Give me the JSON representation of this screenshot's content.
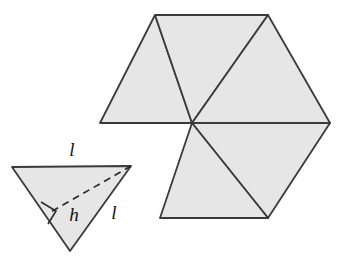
{
  "figure": {
    "title": "Equilateral triangle with altitude and hexagon net of six triangles",
    "background_color": "#ffffff",
    "fill_color": "#e6e6e6",
    "stroke_color": "#3a3a3a",
    "label_color": "#111111",
    "stroke_width": 1.8
  },
  "triangle": {
    "name": "labelled-equilateral-triangle",
    "vertices": {
      "top_left": [
        12,
        167
      ],
      "top_right": [
        131,
        166
      ],
      "bottom_apex": [
        70,
        251
      ]
    },
    "altitude": {
      "from": [
        131,
        166
      ],
      "to": [
        49,
        213
      ],
      "style": "dashed",
      "label": "h",
      "label_position": [
        74,
        216
      ]
    },
    "right_angle_marker": {
      "present": true,
      "position": [
        49,
        213
      ],
      "size": 16
    },
    "labels": [
      {
        "text": "l",
        "position": [
          72,
          152
        ],
        "side": "top-edge"
      },
      {
        "text": "h",
        "position": [
          74,
          216
        ],
        "side": "altitude"
      },
      {
        "text": "l",
        "position": [
          114,
          214
        ],
        "side": "right-edge"
      }
    ]
  },
  "hexagon_net": {
    "name": "hexagon-net-five-triangles",
    "center": [
      192,
      123
    ],
    "outer_vertices": {
      "left": [
        100,
        123
      ],
      "top_left": [
        155,
        15
      ],
      "top_right": [
        268,
        15
      ],
      "right": [
        330,
        123
      ],
      "bottom_right": [
        268,
        218
      ],
      "bottom_left": [
        160,
        218
      ]
    },
    "triangle_count": 5,
    "missing_wedge": "lower-left",
    "wedges": [
      {
        "id": "upper-left",
        "filled": true,
        "points": [
          [
            192,
            123
          ],
          [
            100,
            123
          ],
          [
            155,
            15
          ]
        ]
      },
      {
        "id": "upper-middle",
        "filled": true,
        "points": [
          [
            192,
            123
          ],
          [
            155,
            15
          ],
          [
            268,
            15
          ]
        ]
      },
      {
        "id": "upper-right",
        "filled": true,
        "points": [
          [
            192,
            123
          ],
          [
            268,
            15
          ],
          [
            330,
            123
          ]
        ]
      },
      {
        "id": "lower-right",
        "filled": true,
        "points": [
          [
            192,
            123
          ],
          [
            330,
            123
          ],
          [
            268,
            218
          ]
        ]
      },
      {
        "id": "lower-middle",
        "filled": true,
        "points": [
          [
            192,
            123
          ],
          [
            268,
            218
          ],
          [
            160,
            218
          ]
        ]
      },
      {
        "id": "lower-left",
        "filled": false,
        "points": [
          [
            192,
            123
          ],
          [
            160,
            218
          ],
          [
            100,
            123
          ]
        ]
      }
    ]
  }
}
